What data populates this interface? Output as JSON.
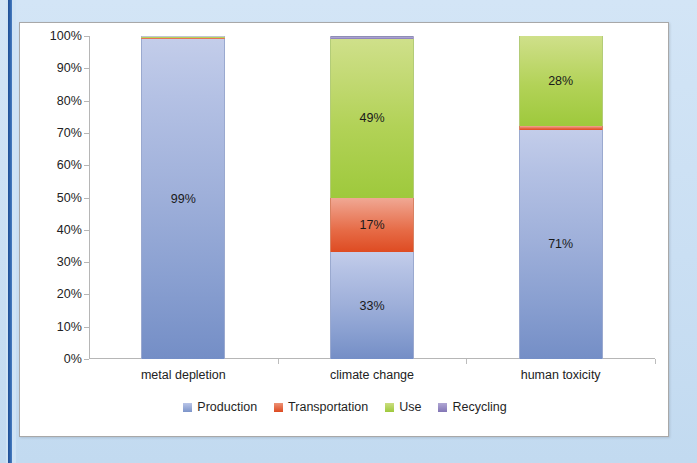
{
  "frame": {
    "background_color": "#cfe3f5",
    "accent_bar_color": "#1f4e93",
    "panel_background": "#ffffff",
    "panel_border_color": "#a8a8a8"
  },
  "chart_data": {
    "type": "bar",
    "subtype": "100% stacked column",
    "title": "",
    "xlabel": "",
    "ylabel": "",
    "ylim": [
      0,
      100
    ],
    "grid": false,
    "legend_position": "bottom-center",
    "categories": [
      "metal depletion",
      "climate change",
      "human toxicity"
    ],
    "ytick_labels": [
      "100%",
      "90%",
      "80%",
      "70%",
      "60%",
      "50%",
      "40%",
      "30%",
      "20%",
      "10%",
      "0%"
    ],
    "ytick_values": [
      100,
      90,
      80,
      70,
      60,
      50,
      40,
      30,
      20,
      10,
      0
    ],
    "series": [
      {
        "name": "Production",
        "color": "#7c94c9",
        "values": [
          99,
          33,
          71
        ],
        "labels": [
          "99%",
          "33%",
          "71%"
        ],
        "label_visible": [
          true,
          true,
          true
        ]
      },
      {
        "name": "Transportation",
        "color": "#dd4a20",
        "values": [
          0.5,
          17,
          1
        ],
        "labels": [
          "",
          "17%",
          "1%"
        ],
        "label_visible": [
          false,
          true,
          true
        ]
      },
      {
        "name": "Use",
        "color": "#9ec93c",
        "values": [
          0.3,
          49,
          28
        ],
        "labels": [
          "",
          "49%",
          "28%"
        ],
        "label_visible": [
          false,
          true,
          true
        ]
      },
      {
        "name": "Recycling",
        "color": "#8275b5",
        "values": [
          0.2,
          1,
          0
        ],
        "labels": [
          "",
          "",
          ""
        ],
        "label_visible": [
          false,
          false,
          false
        ]
      }
    ]
  },
  "legend": {
    "items": [
      {
        "label": "Production"
      },
      {
        "label": "Transportation"
      },
      {
        "label": "Use"
      },
      {
        "label": "Recycling"
      }
    ]
  }
}
